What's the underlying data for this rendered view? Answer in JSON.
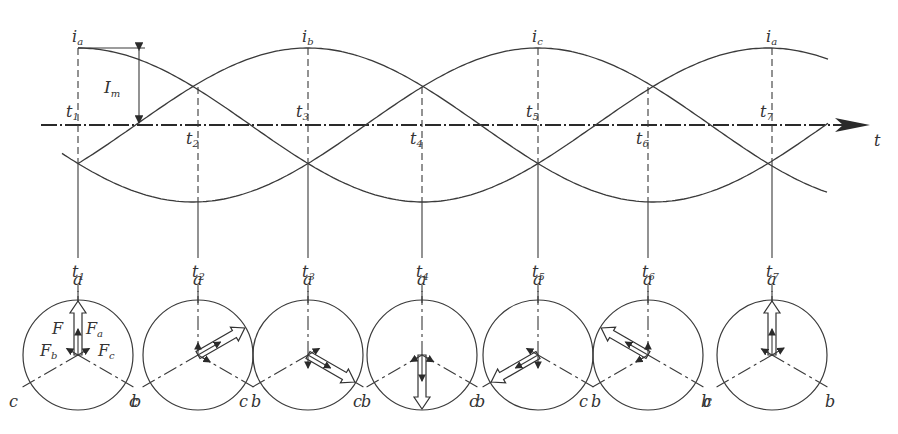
{
  "figure": {
    "axis": {
      "label": "t"
    },
    "amplitude_label": {
      "main": "I",
      "sub": "m"
    },
    "peak_labels": [
      {
        "main": "i",
        "sub": "a",
        "x": 78
      },
      {
        "main": "i",
        "sub": "b",
        "x": 308
      },
      {
        "main": "i",
        "sub": "c",
        "x": 538
      },
      {
        "main": "i",
        "sub": "a",
        "x": 772
      }
    ],
    "time_instants": [
      {
        "main": "t",
        "sub": "1",
        "x": 78
      },
      {
        "main": "t",
        "sub": "2",
        "x": 198
      },
      {
        "main": "t",
        "sub": "3",
        "x": 308
      },
      {
        "main": "t",
        "sub": "4",
        "x": 422
      },
      {
        "main": "t",
        "sub": "5",
        "x": 538
      },
      {
        "main": "t",
        "sub": "6",
        "x": 648
      },
      {
        "main": "t",
        "sub": "7",
        "x": 772
      }
    ],
    "phasor_diagrams": [
      {
        "instant": "t1",
        "F_direction": "a",
        "labels": {
          "F": "F",
          "Fa": "F",
          "Fa_sub": "a",
          "Fb": "F",
          "Fb_sub": "b",
          "Fc": "F",
          "Fc_sub": "c"
        }
      },
      {
        "instant": "t2",
        "F_direction": "-c"
      },
      {
        "instant": "t3",
        "F_direction": "b"
      },
      {
        "instant": "t4",
        "F_direction": "-a"
      },
      {
        "instant": "t5",
        "F_direction": "c"
      },
      {
        "instant": "t6",
        "F_direction": "-b"
      },
      {
        "instant": "t7",
        "F_direction": "a"
      }
    ],
    "axis_letters": {
      "a": "a",
      "b": "b",
      "c": "c"
    }
  }
}
